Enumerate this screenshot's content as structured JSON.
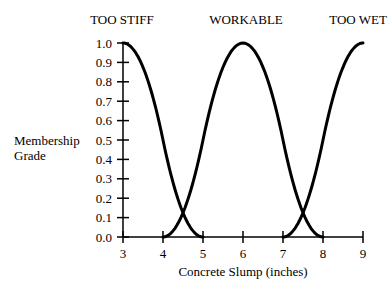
{
  "chart_data": {
    "type": "line",
    "title": "",
    "xlabel": "Concrete Slump (inches)",
    "ylabel": "Membership Grade",
    "ylabel_lines": [
      "Membership",
      "Grade"
    ],
    "xlim": [
      3,
      9
    ],
    "ylim": [
      0.0,
      1.0
    ],
    "x_ticks": [
      "3",
      "4",
      "5",
      "6",
      "7",
      "8",
      "9"
    ],
    "y_ticks": [
      "0.0",
      "0.1",
      "0.2",
      "0.3",
      "0.4",
      "0.5",
      "0.6",
      "0.7",
      "0.8",
      "0.9",
      "1.0"
    ],
    "grid": false,
    "legend": "none",
    "series": [
      {
        "name": "TOO STIFF",
        "x": [
          3,
          3.5,
          4,
          4.5,
          5
        ],
        "values": [
          1.0,
          0.7,
          0.25,
          0.13,
          0.0
        ]
      },
      {
        "name": "WORKABLE",
        "x": [
          4,
          4.5,
          5,
          5.5,
          6,
          6.5,
          7,
          7.5,
          8
        ],
        "values": [
          0.0,
          0.13,
          0.25,
          0.7,
          1.0,
          0.7,
          0.25,
          0.13,
          0.0
        ]
      },
      {
        "name": "TOO WET",
        "x": [
          7,
          7.5,
          8,
          8.5,
          9
        ],
        "values": [
          0.0,
          0.13,
          0.25,
          0.7,
          1.0
        ]
      }
    ],
    "annotations": [
      "TOO STIFF",
      "WORKABLE",
      "TOO WET"
    ]
  }
}
